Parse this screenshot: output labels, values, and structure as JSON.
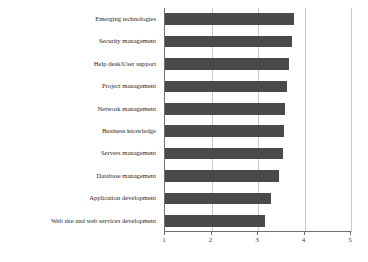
{
  "chart_data": {
    "type": "bar",
    "orientation": "horizontal",
    "title": "",
    "subtitle": "",
    "xlabel": "",
    "ylabel": "",
    "xlim": [
      1,
      5
    ],
    "grid": true,
    "legend": false,
    "xticks": [
      "1",
      "2",
      "3",
      "4",
      "5"
    ],
    "xtick_values": [
      1,
      2,
      3,
      4,
      5
    ],
    "bar_color": "#4a4a4a",
    "categories": [
      "Emerging technologies",
      "Security management",
      "Help desk/User support",
      "Project management",
      "Network management",
      "Business knowledge",
      "Servers management",
      "Database management",
      "Application development",
      "Web site and web services development"
    ],
    "values": [
      3.78,
      3.74,
      3.67,
      3.63,
      3.58,
      3.55,
      3.54,
      3.45,
      3.28,
      3.15
    ]
  },
  "axis": {
    "x_min_label": "1",
    "x_max_label": "5"
  }
}
